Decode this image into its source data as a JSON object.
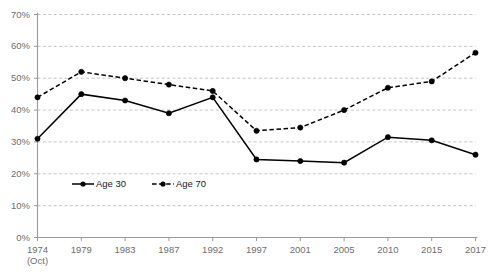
{
  "chart_data": {
    "type": "line",
    "title": "",
    "subtitle": "",
    "xlabel": "",
    "ylabel": "",
    "grid": true,
    "legend_position": "inside-bottom-left",
    "ylim": [
      0,
      70
    ],
    "ytick_labels": [
      "70%",
      "60%",
      "50%",
      "40%",
      "30%",
      "20%",
      "10%",
      "0%"
    ],
    "ytick_values": [
      70,
      60,
      50,
      40,
      30,
      20,
      10,
      0
    ],
    "categories": [
      "1974",
      "1979",
      "1983",
      "1987",
      "1992",
      "1997",
      "2001",
      "2005",
      "2010",
      "2015",
      "2017"
    ],
    "category_sublabels": [
      "(Oct)",
      "",
      "",
      "",
      "",
      "",
      "",
      "",
      "",
      "",
      ""
    ],
    "series": [
      {
        "name": "Age 30",
        "style": "solid",
        "color": "#000000",
        "marker": "circle",
        "values": [
          31,
          45,
          43,
          39,
          44,
          24.5,
          24,
          23.5,
          31.5,
          30.5,
          26
        ]
      },
      {
        "name": "Age 70",
        "style": "dashed",
        "color": "#000000",
        "marker": "circle",
        "values": [
          44,
          52,
          50,
          48,
          46,
          33.5,
          34.5,
          40,
          47,
          49,
          58
        ]
      }
    ]
  },
  "legend": {
    "items": [
      {
        "label": "Age 30"
      },
      {
        "label": "Age 70"
      }
    ]
  },
  "colors": {
    "axis": "#9a9a9a",
    "grid": "#b5b5b5",
    "text": "#6e6e6e",
    "series": "#000000"
  }
}
